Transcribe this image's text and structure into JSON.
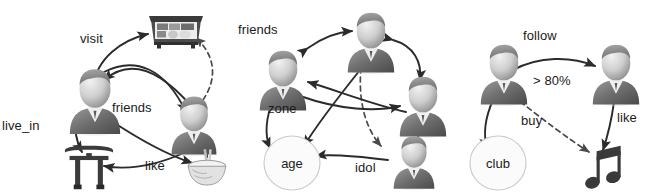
{
  "figure": {
    "background_color": "#ffffff",
    "ink_color": "#2b2b2b",
    "panel_count": 3
  },
  "panels": [
    {
      "id": "panel-left",
      "name": "left-graph",
      "nodes": [
        {
          "id": "p1",
          "type": "person",
          "icon": "person-avatar-icon",
          "label": "",
          "x": 95,
          "y": 100
        },
        {
          "id": "p2",
          "type": "person",
          "icon": "person-avatar-icon",
          "label": "",
          "x": 193,
          "y": 120
        },
        {
          "id": "sushi",
          "type": "object",
          "icon": "sushi-box-icon",
          "label": "",
          "x": 175,
          "y": 30
        },
        {
          "id": "torii",
          "type": "object",
          "icon": "torii-gate-icon",
          "label": "",
          "x": 88,
          "y": 165
        },
        {
          "id": "bowl",
          "type": "object",
          "icon": "noodle-bowl-icon",
          "label": "",
          "x": 207,
          "y": 168
        }
      ],
      "edges": [
        {
          "from": "p1",
          "to": "sushi",
          "label": "visit",
          "style": "solid",
          "direction": "forward"
        },
        {
          "from": "p2",
          "to": "sushi",
          "label": "",
          "style": "dashed",
          "direction": "forward"
        },
        {
          "from": "p1",
          "to": "p2",
          "label": "friends",
          "style": "solid",
          "direction": "both"
        },
        {
          "from": "p1",
          "to": "torii",
          "label": "live_in",
          "style": "solid",
          "direction": "forward"
        },
        {
          "from": "p2",
          "to": "torii",
          "label": "",
          "style": "solid",
          "direction": "forward"
        },
        {
          "from": "p1",
          "to": "bowl",
          "label": "like",
          "style": "solid",
          "direction": "forward"
        },
        {
          "from": "p2",
          "to": "bowl",
          "label": "",
          "style": "solid",
          "direction": "forward"
        }
      ],
      "labels": [
        "visit",
        "friends",
        "live_in",
        "like"
      ]
    },
    {
      "id": "panel-mid",
      "name": "middle-graph",
      "nodes": [
        {
          "id": "m1",
          "type": "person",
          "icon": "person-avatar-icon",
          "label": "",
          "x": 52,
          "y": 78
        },
        {
          "id": "m2",
          "type": "person",
          "icon": "person-avatar-icon",
          "label": "",
          "x": 140,
          "y": 40
        },
        {
          "id": "m3",
          "type": "person",
          "icon": "person-avatar-icon",
          "label": "",
          "x": 193,
          "y": 105
        },
        {
          "id": "m4",
          "type": "person",
          "icon": "person-avatar-icon",
          "label": "idol",
          "x": 168,
          "y": 165
        },
        {
          "id": "age",
          "type": "attribute",
          "icon": "attribute-circle",
          "label": "age",
          "x": 62,
          "y": 160
        }
      ],
      "edges": [
        {
          "from": "m1",
          "to": "m2",
          "label": "friends",
          "style": "solid",
          "direction": "both"
        },
        {
          "from": "m2",
          "to": "m3",
          "label": "",
          "style": "solid",
          "direction": "both"
        },
        {
          "from": "m2",
          "to": "m4",
          "label": "",
          "style": "dashed",
          "direction": "forward"
        },
        {
          "from": "m1",
          "to": "age",
          "label": "zone",
          "style": "solid",
          "direction": "forward"
        },
        {
          "from": "m3",
          "to": "m1",
          "label": "",
          "style": "solid",
          "direction": "forward"
        },
        {
          "from": "m2",
          "to": "age",
          "label": "",
          "style": "solid",
          "direction": "forward"
        },
        {
          "from": "m1",
          "to": "m3",
          "label": "",
          "style": "solid",
          "direction": "forward"
        },
        {
          "from": "m3",
          "to": "m4",
          "label": "",
          "style": "solid",
          "direction": "forward"
        },
        {
          "from": "m4",
          "to": "age",
          "label": "",
          "style": "solid",
          "direction": "forward"
        }
      ],
      "labels": [
        "friends",
        "zone",
        "age",
        "idol"
      ]
    },
    {
      "id": "panel-right",
      "name": "right-graph",
      "nodes": [
        {
          "id": "r1",
          "type": "person",
          "icon": "person-avatar-icon",
          "label": "",
          "x": 48,
          "y": 72
        },
        {
          "id": "r2",
          "type": "person",
          "icon": "person-avatar-icon",
          "label": "",
          "x": 160,
          "y": 72
        },
        {
          "id": "club",
          "type": "attribute",
          "icon": "attribute-circle",
          "label": "club",
          "x": 50,
          "y": 160
        },
        {
          "id": "music",
          "type": "object",
          "icon": "music-note-icon",
          "label": "",
          "x": 152,
          "y": 162
        }
      ],
      "edges": [
        {
          "from": "r1",
          "to": "r2",
          "label": "follow",
          "sub_label": "> 80%",
          "style": "solid",
          "direction": "forward"
        },
        {
          "from": "r1",
          "to": "club",
          "label": "",
          "style": "solid",
          "direction": "forward"
        },
        {
          "from": "r1",
          "to": "music",
          "label": "buy",
          "style": "dashed",
          "direction": "forward"
        },
        {
          "from": "r2",
          "to": "music",
          "label": "like",
          "style": "solid",
          "direction": "forward"
        }
      ],
      "labels": [
        "follow",
        "> 80%",
        "buy",
        "like"
      ]
    }
  ],
  "text": {
    "left": {
      "visit": "visit",
      "friends": "friends",
      "live_in": "live_in",
      "like": "like"
    },
    "mid": {
      "friends": "friends",
      "zone": "zone",
      "age": "age",
      "idol": "idol"
    },
    "right": {
      "follow": "follow",
      "threshold": "> 80%",
      "buy": "buy",
      "like": "like",
      "club": "club"
    }
  }
}
